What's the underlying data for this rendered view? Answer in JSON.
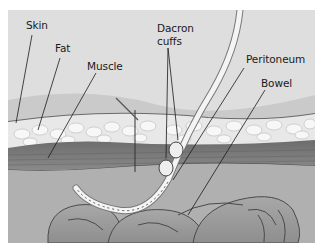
{
  "figure": {
    "labels": {
      "skin": "Skin",
      "fat": "Fat",
      "muscle": "Muscle",
      "dacron_line1": "Dacron",
      "dacron_line2": "cuffs",
      "peritoneum": "Peritoneum",
      "bowel": "Bowel"
    },
    "colors": {
      "background": "#dcdcdc",
      "fat": "#e6e6e6",
      "muscle": "#7a7a7a",
      "bowel": "#9a9a9a",
      "catheter": "#f0f0f0",
      "leader_line": "#1a1a1a"
    }
  }
}
